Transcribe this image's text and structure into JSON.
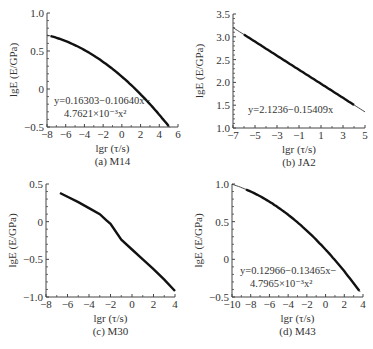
{
  "chart_data": [
    {
      "panel": "a",
      "type": "line",
      "caption": "(a) M14",
      "xlabel": "lgr (τ/s)",
      "ylabel": "lgE (E/GPa)",
      "xlim": [
        -8,
        6
      ],
      "ylim": [
        -0.5,
        1.0
      ],
      "xticks": [
        -8,
        -6,
        -4,
        -2,
        0,
        2,
        4,
        6
      ],
      "yticks": [
        -0.5,
        0,
        0.5,
        1.0
      ],
      "ytick_labels": [
        "−0.5",
        "0",
        "0.5",
        "1.0"
      ],
      "fit": {
        "kind": "quadratic",
        "a": 0.16303,
        "b": -0.1064,
        "c": -0.0047621,
        "x_range": [
          -8,
          5.1
        ]
      },
      "equation_lines": [
        "y=0.16303−0.10640x−",
        "4.7621×10⁻³x²"
      ],
      "data_x_range": [
        -7.6,
        5.0
      ]
    },
    {
      "panel": "b",
      "type": "line",
      "caption": "(b) JA2",
      "xlabel": "lgr (τ/s)",
      "ylabel": "lgE (E/GPa)",
      "xlim": [
        -7,
        5
      ],
      "ylim": [
        1.0,
        3.5
      ],
      "xticks": [
        -7,
        -5,
        -3,
        -1,
        1,
        3,
        5
      ],
      "yticks": [
        1.0,
        1.5,
        2.0,
        2.5,
        3.0,
        3.5
      ],
      "ytick_labels": [
        "1.0",
        "1.5",
        "2.0",
        "2.5",
        "3.0",
        "3.5"
      ],
      "fit": {
        "kind": "linear",
        "a": 2.1236,
        "b": -0.15409,
        "c": 0,
        "x_range": [
          -7,
          5
        ]
      },
      "equation_lines": [
        "y=2.1236−0.15409x"
      ],
      "data_x_range": [
        -6.0,
        4.0
      ]
    },
    {
      "panel": "c",
      "type": "line",
      "caption": "(c) M30",
      "xlabel": "lgr (τ/s)",
      "ylabel": "lgE (E/GPa)",
      "xlim": [
        -8,
        4
      ],
      "ylim": [
        -1.0,
        0.5
      ],
      "xticks": [
        -8,
        -6,
        -4,
        -2,
        0,
        2,
        4
      ],
      "yticks": [
        -1.0,
        -0.5,
        0,
        0.5
      ],
      "ytick_labels": [
        "−1.0",
        "−0.5",
        "0",
        "0.5"
      ],
      "points": {
        "x": [
          -6.7,
          -6.0,
          -5.0,
          -4.0,
          -3.0,
          -2.4,
          -2.0,
          -1.0,
          0.0,
          1.0,
          2.0,
          3.0,
          4.0
        ],
        "y": [
          0.38,
          0.33,
          0.26,
          0.18,
          0.1,
          0.02,
          -0.03,
          -0.24,
          -0.37,
          -0.5,
          -0.63,
          -0.77,
          -0.92
        ]
      },
      "equation_lines": []
    },
    {
      "panel": "d",
      "type": "line",
      "caption": "(d) M43",
      "xlabel": "lgr (τ/s)",
      "ylabel": "lgE (E/GPa)",
      "xlim": [
        -10,
        4
      ],
      "ylim": [
        -0.5,
        1.0
      ],
      "xticks": [
        -10,
        -8,
        -6,
        -4,
        -2,
        0,
        2,
        4
      ],
      "yticks": [
        -0.5,
        0,
        0.5,
        1.0
      ],
      "ytick_labels": [
        "−0.5",
        "0",
        "0.5",
        "1.0"
      ],
      "fit": {
        "kind": "quadratic",
        "a": 0.12966,
        "b": -0.13465,
        "c": -0.0047965,
        "x_range": [
          -10,
          3.7
        ]
      },
      "equation_lines": [
        "y=0.12966−0.13465x−",
        "4.7965×10⁻³x²"
      ],
      "data_x_range": [
        -8.5,
        3.6
      ]
    }
  ]
}
